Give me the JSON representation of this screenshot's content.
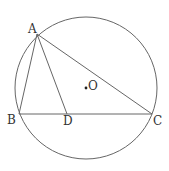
{
  "diagram": {
    "type": "geometry",
    "colors": {
      "stroke": "#666666",
      "text": "#333333",
      "background": "#ffffff"
    },
    "circle": {
      "center_label": "O",
      "cx": 86,
      "cy": 88,
      "r": 71
    },
    "points": {
      "A": {
        "label": "A",
        "x": 37,
        "y": 34
      },
      "B": {
        "label": "B",
        "x": 19,
        "y": 114
      },
      "C": {
        "label": "C",
        "x": 152,
        "y": 114
      },
      "D": {
        "label": "D",
        "x": 67,
        "y": 114
      },
      "O": {
        "label": "O",
        "x": 86,
        "y": 88
      }
    },
    "segments": [
      "AB",
      "AC",
      "BC",
      "AD"
    ]
  }
}
